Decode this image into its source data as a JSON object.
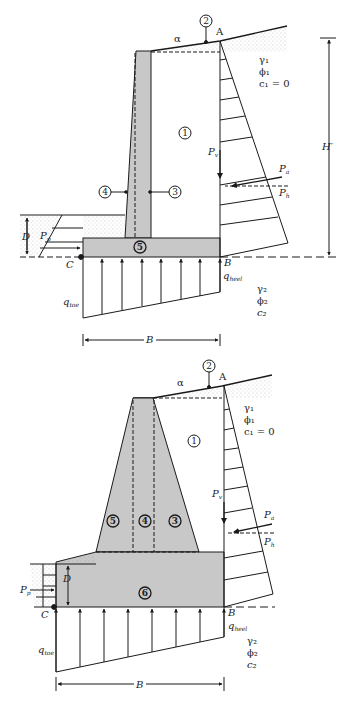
{
  "figure": {
    "type": "retaining-wall-free-body-diagrams",
    "panels": [
      {
        "name": "cantilever-wall",
        "labels": {
          "point_A": "A",
          "point_B": "B",
          "point_C": "C",
          "alpha": "α",
          "H_prime": "H′",
          "D": "D",
          "B_width": "B",
          "P_v": "P",
          "P_v_sub": "v",
          "P_a": "P",
          "P_a_sub": "a",
          "P_h": "P",
          "P_h_sub": "h",
          "P_p": "P",
          "P_p_sub": "p",
          "q_heel": "q",
          "q_heel_sub": "heel",
          "q_toe": "q",
          "q_toe_sub": "toe"
        },
        "soil_above": [
          "γ₁",
          "ϕ₁",
          "c₁ = 0"
        ],
        "soil_below": [
          "γ₂",
          "ϕ₂",
          "c₂"
        ],
        "region_numbers": [
          "1",
          "2",
          "3",
          "4",
          "5"
        ]
      },
      {
        "name": "gravity-wall",
        "labels": {
          "point_A": "A",
          "point_B": "B",
          "point_C": "C",
          "alpha": "α",
          "D": "D",
          "B_width": "B",
          "P_v": "P",
          "P_v_sub": "v",
          "P_a": "P",
          "P_a_sub": "a",
          "P_h": "P",
          "P_h_sub": "h",
          "P_p": "P",
          "P_p_sub": "p",
          "q_heel": "q",
          "q_heel_sub": "heel",
          "q_toe": "q",
          "q_toe_sub": "toe"
        },
        "soil_above": [
          "γ₁",
          "ϕ₁",
          "c₁ = 0"
        ],
        "soil_below": [
          "γ₂",
          "ϕ₂",
          "c₂"
        ],
        "region_numbers": [
          "1",
          "2",
          "3",
          "4",
          "5",
          "6"
        ]
      }
    ],
    "colors": {
      "concrete_fill": "#c8c8c8",
      "line": "#1a1a1a",
      "soil_stipple": "#9a9a9a"
    }
  }
}
